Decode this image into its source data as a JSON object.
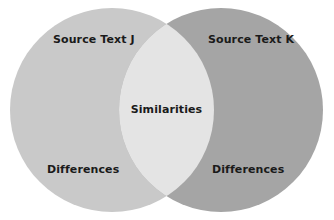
{
  "diagram": {
    "type": "venn",
    "title": "",
    "background_color": "#ffffff",
    "sets": [
      {
        "id": "left",
        "name_label": "Source Text J",
        "region_label": "Differences",
        "fill_color": "#c9c9c9",
        "center_x": 112,
        "center_y": 110,
        "radius": 102
      },
      {
        "id": "right",
        "name_label": "Source Text K",
        "region_label": "Differences",
        "fill_color": "#a5a5a5",
        "center_x": 221,
        "center_y": 110,
        "radius": 102
      }
    ],
    "intersection": {
      "id": "overlap",
      "label": "Similarities",
      "fill_color": "#e4e4e4"
    },
    "text_color": "#1a1a1a"
  }
}
